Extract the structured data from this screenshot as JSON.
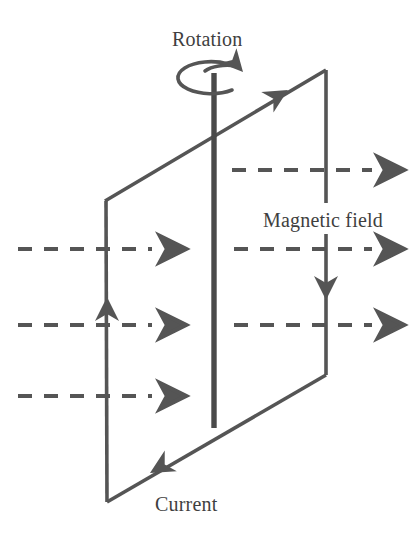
{
  "figure": {
    "title_visible": false,
    "background_color": "#ffffff",
    "stroke_color": "#555555",
    "axle_color": "#4a4a4a",
    "text_color": "#3f3f3f",
    "labels": {
      "rotation": "Rotation",
      "magnetic_field": "Magnetic field",
      "current": "Current"
    },
    "label_positions": {
      "rotation": {
        "x": 172,
        "y": 46
      },
      "magnetic_field": {
        "x": 263,
        "y": 227
      },
      "current": {
        "x": 155,
        "y": 511
      }
    },
    "loop": {
      "description": "rectangular conducting loop drawn in perspective as a parallelogram",
      "corners": {
        "top_left": {
          "x": 105,
          "y": 201
        },
        "top_right": {
          "x": 326,
          "y": 70
        },
        "bottom_right": {
          "x": 326,
          "y": 375
        },
        "bottom_left": {
          "x": 107,
          "y": 502
        }
      },
      "current_direction": "counterclockwise as drawn: up the left edge, right-up along the top edge, down the right edge, left-down along the bottom edge",
      "arrow_markers": [
        {
          "name": "top-edge-current-arrow",
          "x": 285,
          "y": 92,
          "points": "up-right"
        },
        {
          "name": "right-edge-current-arrow",
          "x": 326,
          "y": 297,
          "points": "down"
        },
        {
          "name": "bottom-edge-current-arrow",
          "x": 152,
          "y": 471,
          "points": "down-left"
        },
        {
          "name": "left-edge-current-arrow",
          "x": 107,
          "y": 300,
          "points": "up"
        }
      ]
    },
    "axle": {
      "description": "vertical rotation axle through the loop",
      "x": 214,
      "y_top": 73,
      "y_bottom": 428,
      "width_px": 5
    },
    "rotation_indicator": {
      "description": "elliptical arrow around the top of the axle showing spin direction",
      "center": {
        "x": 205,
        "y": 78
      },
      "rx": 33,
      "ry": 16,
      "arrow_points": "clockwise viewed from above"
    },
    "field_lines": {
      "description": "horizontal dashed magnetic field lines pointing to the right",
      "direction": "left to right",
      "count": 6,
      "rows": [
        {
          "name": "field-line-1",
          "y": 170,
          "x_start": 232,
          "x_end": 404,
          "side": "right"
        },
        {
          "name": "field-line-2",
          "y": 249,
          "x_start": 18,
          "x_end": 186,
          "side": "left"
        },
        {
          "name": "field-line-3",
          "y": 249,
          "x_start": 234,
          "x_end": 404,
          "side": "right"
        },
        {
          "name": "field-line-4",
          "y": 325,
          "x_start": 18,
          "x_end": 186,
          "side": "left"
        },
        {
          "name": "field-line-5",
          "y": 325,
          "x_start": 234,
          "x_end": 404,
          "side": "right"
        },
        {
          "name": "field-line-6",
          "y": 396,
          "x_start": 18,
          "x_end": 186,
          "side": "left"
        }
      ],
      "dash_pattern": "14 12"
    }
  }
}
